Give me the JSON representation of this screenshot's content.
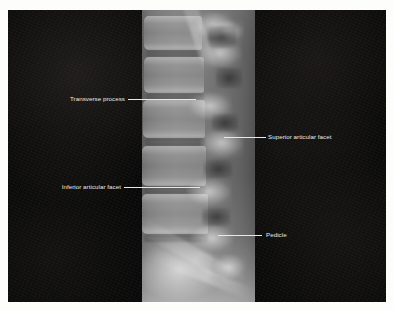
{
  "figure": {
    "type": "radiograph",
    "view": "lateral lumbar spine X-ray",
    "background_color": "#ffffff",
    "plate_color": "#060606",
    "label_text_color": "#e9e9e7",
    "leader_line_color": "#e8e8e6",
    "strip_description": "vertical grayscale exposed X-ray band"
  },
  "annotations": [
    {
      "id": "transverse-process",
      "label": "Transverse process",
      "side": "left",
      "label_x": 52,
      "label_y": 95,
      "leader_x": 128,
      "leader_y": 99,
      "leader_width": 68
    },
    {
      "id": "superior-articular-facet",
      "label": "Superior articular facet",
      "side": "right",
      "label_x": 268,
      "label_y": 133,
      "leader_x": 224,
      "leader_y": 137,
      "leader_width": 42
    },
    {
      "id": "inferior-articular-facet",
      "label": "Inferior articular facet",
      "side": "left",
      "label_x": 45,
      "label_y": 183,
      "leader_x": 124,
      "leader_y": 187,
      "leader_width": 76
    },
    {
      "id": "pedicle",
      "label": "Pedicle",
      "side": "right",
      "label_x": 266,
      "label_y": 231,
      "leader_x": 218,
      "leader_y": 235,
      "leader_width": 44
    }
  ]
}
